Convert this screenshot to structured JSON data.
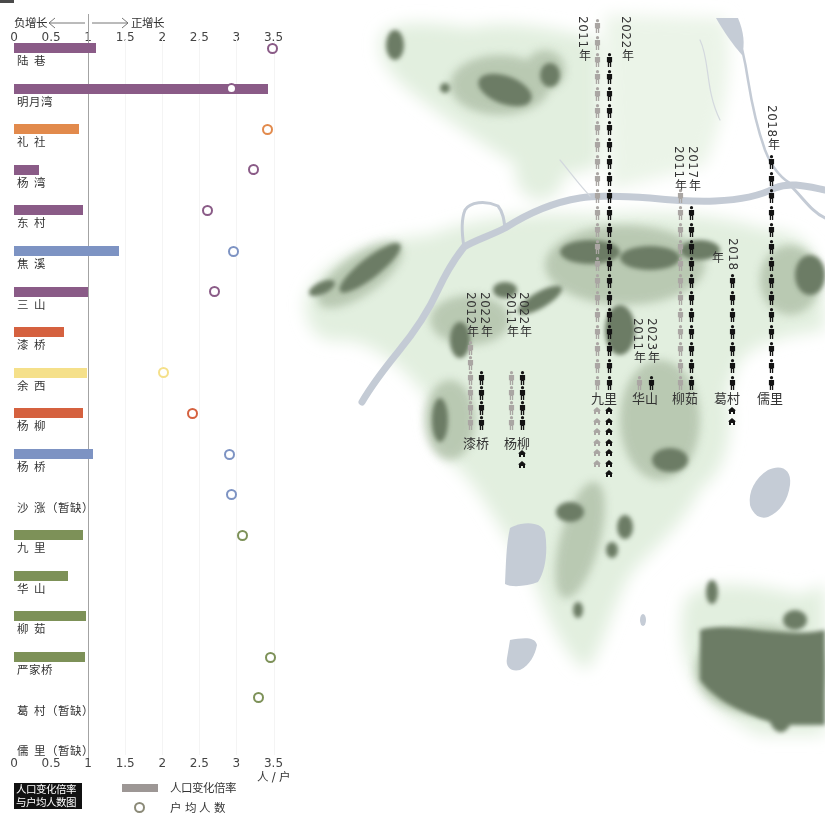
{
  "chart_panel": {
    "growth_header": {
      "negative_label": "负增长",
      "positive_label": "正增长"
    },
    "tick_labels": [
      "0",
      "0.5",
      "1",
      "1.5",
      "2",
      "2.5",
      "3",
      "3.5"
    ],
    "unit_label": "人 / 户",
    "legend": {
      "title_line1": "人口变化倍率",
      "title_line2": "与户均人数图",
      "bar_label": "人口变化倍率",
      "circle_label": "户 均 人 数",
      "bar_color": "#9d9795",
      "circle_color": "#8b8a78"
    }
  },
  "chart_data": {
    "type": "bar",
    "orientation": "horizontal",
    "categories": [
      "陆 巷",
      "明月湾",
      "礼 社",
      "杨 湾",
      "东 村",
      "焦 溪",
      "三 山",
      "漆 桥",
      "余 西",
      "杨 柳",
      "杨 桥",
      "沙 涨（暂缺）",
      "九 里",
      "华 山",
      "柳 茹",
      "严家桥",
      "葛 村（暂缺）",
      "儒 里（暂缺）"
    ],
    "series": [
      {
        "name": "人口变化倍率",
        "type": "bar",
        "values": [
          1.11,
          3.43,
          0.88,
          0.34,
          0.93,
          1.42,
          1.0,
          0.68,
          0.99,
          0.93,
          1.06,
          null,
          0.93,
          0.73,
          0.97,
          0.96,
          null,
          null
        ]
      },
      {
        "name": "户均人数",
        "type": "scatter",
        "values": [
          3.48,
          2.93,
          3.42,
          3.23,
          2.61,
          2.96,
          2.7,
          null,
          2.01,
          2.41,
          2.9,
          2.93,
          3.08,
          null,
          null,
          3.46,
          3.3,
          null
        ]
      }
    ],
    "colors": [
      "#8a5b87",
      "#8a5b87",
      "#e28a4c",
      "#8a5b87",
      "#8a5b87",
      "#7d93c3",
      "#8a5b87",
      "#d5613f",
      "#f5e08a",
      "#d5613f",
      "#7d93c3",
      "#7d93c3",
      "#7d9158",
      "#7d9158",
      "#7d9158",
      "#7d9158",
      "#7d9158",
      "#7d9158"
    ],
    "x_ticks": [
      0,
      0.5,
      1,
      1.5,
      2,
      2.5,
      3,
      3.5
    ],
    "xlim": [
      0,
      3.5
    ],
    "reference_line": 1,
    "xlabel": "人 / 户",
    "ylabel": "",
    "annotations": [
      "负增长",
      "正增长"
    ],
    "legend": [
      "人口变化倍率",
      "户 均 人 数"
    ],
    "legend_position": "bottom-left",
    "grid": false
  },
  "map": {
    "year_suffix": "年",
    "colors": {
      "gray": "#aaa6a3",
      "black": "#141414"
    },
    "villages": [
      {
        "name": "漆桥",
        "columns": [
          {
            "year": "2012",
            "tone": "gray",
            "people": 6
          },
          {
            "year": "2022",
            "tone": "black",
            "people": 4
          }
        ],
        "houses": {
          "gray": 0,
          "black": 0
        }
      },
      {
        "name": "杨柳",
        "columns": [
          {
            "year": "2011",
            "tone": "gray",
            "people": 4
          },
          {
            "year": "2022",
            "tone": "black",
            "people": 4
          }
        ],
        "houses": {
          "gray": 0,
          "black": 2
        }
      },
      {
        "name": "九里",
        "columns": [
          {
            "year": "2011",
            "tone": "gray",
            "people": 22
          },
          {
            "year": "2022",
            "tone": "black",
            "people": 20
          }
        ],
        "houses": {
          "gray": 6,
          "black": 7
        }
      },
      {
        "name": "华山",
        "columns": [
          {
            "year": "2011",
            "tone": "gray",
            "people": 1
          },
          {
            "year": "2023",
            "tone": "black",
            "people": 1
          }
        ],
        "houses": {
          "gray": 0,
          "black": 0
        }
      },
      {
        "name": "柳茹",
        "columns": [
          {
            "year": "2011",
            "tone": "gray",
            "people": 12
          },
          {
            "year": "2017",
            "tone": "black",
            "people": 11
          }
        ],
        "houses": {
          "gray": 0,
          "black": 0
        }
      },
      {
        "name": "葛村",
        "columns": [
          {
            "year": "2018",
            "tone": "black",
            "people": 7
          }
        ],
        "houses": {
          "gray": 0,
          "black": 2
        }
      },
      {
        "name": "儒里",
        "columns": [
          {
            "year": "2018",
            "tone": "black",
            "people": 14
          }
        ],
        "houses": {
          "gray": 0,
          "black": 0
        }
      }
    ]
  }
}
